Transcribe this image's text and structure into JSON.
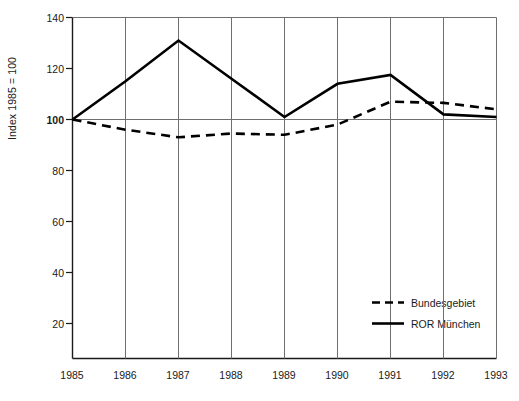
{
  "chart_data": {
    "type": "line",
    "title": "",
    "xlabel": "",
    "ylabel": "Index 1985 = 100",
    "categories": [
      "1985",
      "1986",
      "1987",
      "1988",
      "1989",
      "1990",
      "1991",
      "1992",
      "1993"
    ],
    "x": [
      1985,
      1986,
      1987,
      1988,
      1989,
      1990,
      1991,
      1992,
      1993
    ],
    "ylim": [
      6.7,
      140
    ],
    "yticks": [
      20,
      40,
      60,
      80,
      100,
      120,
      140
    ],
    "ytick_labels": [
      "20",
      "40",
      "60",
      "80",
      "100",
      "120",
      "140"
    ],
    "grid": "vertical-gridlines-at-each-year-plus-horizontal-reference-at-100",
    "reference_line": 100,
    "legend_position": "inside-bottom-right",
    "series": [
      {
        "name": "Bundesgebiet",
        "style": "dashed",
        "color": "#000000",
        "values": [
          100,
          96,
          93,
          94.5,
          94,
          98,
          107,
          106.5,
          104
        ]
      },
      {
        "name": "ROR München",
        "style": "solid",
        "color": "#000000",
        "values": [
          100,
          115,
          131,
          116,
          101,
          114,
          117.5,
          102,
          101
        ]
      }
    ]
  },
  "axis": {
    "y_title": "Index 1985 = 100",
    "y_tick_labels": [
      "140",
      "120",
      "100",
      "80",
      "60",
      "40",
      "20"
    ],
    "x_tick_labels": [
      "1985",
      "1986",
      "1987",
      "1988",
      "1989",
      "1990",
      "1991",
      "1992",
      "1993"
    ],
    "emphasized_y_tick": "100"
  },
  "legend": {
    "entries": [
      {
        "label": "Bundesgebiet",
        "style": "dashed"
      },
      {
        "label": "ROR München",
        "style": "solid"
      }
    ]
  },
  "colors": {
    "line": "#000000",
    "axis": "#1a1a1a",
    "gridline": "#7a7a7a",
    "background": "#ffffff"
  }
}
